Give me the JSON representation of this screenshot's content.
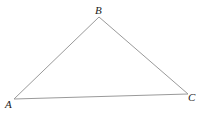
{
  "diagram": {
    "type": "triangle",
    "vertices": [
      {
        "name": "A",
        "x": 14,
        "y": 99
      },
      {
        "name": "B",
        "x": 99,
        "y": 17
      },
      {
        "name": "C",
        "x": 188,
        "y": 94
      }
    ],
    "edges": [
      {
        "from": "A",
        "to": "B"
      },
      {
        "from": "B",
        "to": "C"
      },
      {
        "from": "A",
        "to": "C"
      }
    ],
    "labels": {
      "A": "A",
      "B": "B",
      "C": "C"
    },
    "colors": {
      "edge": "#9a9a9a",
      "label": "#222222",
      "background": "#ffffff"
    }
  }
}
